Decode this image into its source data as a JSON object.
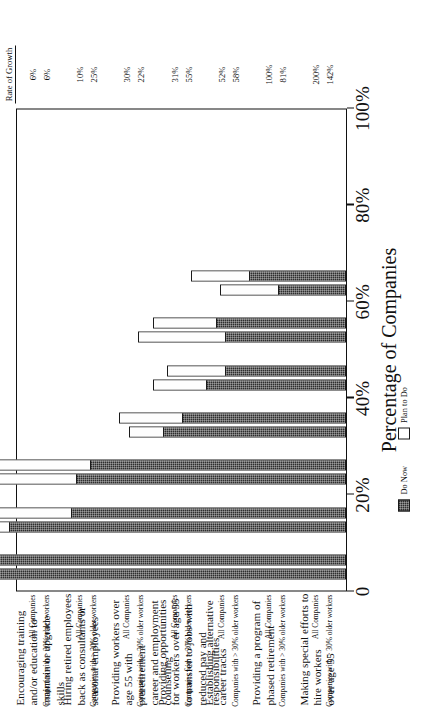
{
  "chart_data": {
    "type": "bar",
    "orientation": "horizontal-stacked",
    "title": "",
    "xlabel": "Percentage of Companies",
    "ylabel": "",
    "xlim": [
      0,
      100
    ],
    "xticks": [
      0,
      20,
      40,
      60,
      80,
      100
    ],
    "xticklabels": [
      "0",
      "20%",
      "40%",
      "60%",
      "80%",
      "100%"
    ],
    "grid": false,
    "legend_position": "below-axis",
    "legend": [
      "Do Now",
      "Plan to Do"
    ],
    "series_names": [
      "All Companies",
      "Companies with > 30% older workers"
    ],
    "categories": [
      "Encouraging training and/or education to\nmaintain or upgrade skills",
      "Hiring retired employees back as consultants or\nseasonal employees",
      "Providing workers over age 55 with preretirement\ncareer and employment counseling",
      "Providing opportunities for workers over age 55\nto transfer to jobs with reduced pay and responsibilities",
      "Establishing alternative career tracks",
      "Providing a program of phased retirement",
      "Making special efforts to hire workers\nover age 55"
    ],
    "rate_of_growth_header": "Rate of Growth",
    "bars": [
      {
        "category_index": 0,
        "series": "All Companies",
        "do_now": 80,
        "plan_to_do": 5,
        "total": 85,
        "rate_of_growth": "6%"
      },
      {
        "category_index": 0,
        "series": "Companies with > 30% older workers",
        "do_now": 84,
        "plan_to_do": 6,
        "total": 90,
        "rate_of_growth": "6%"
      },
      {
        "category_index": 1,
        "series": "All Companies",
        "do_now": 70,
        "plan_to_do": 8,
        "total": 78,
        "rate_of_growth": "10%"
      },
      {
        "category_index": 1,
        "series": "Companies with > 30% older workers",
        "do_now": 57,
        "plan_to_do": 30,
        "total": 87,
        "rate_of_growth": "25%"
      },
      {
        "category_index": 2,
        "series": "All Companies",
        "do_now": 56,
        "plan_to_do": 25,
        "total": 81,
        "rate_of_growth": "30%"
      },
      {
        "category_index": 2,
        "series": "Companies with > 30% older workers",
        "do_now": 53,
        "plan_to_do": 20,
        "total": 73,
        "rate_of_growth": "22%"
      },
      {
        "category_index": 3,
        "series": "All Companies",
        "do_now": 38,
        "plan_to_do": 7,
        "total": 45,
        "rate_of_growth": "31%"
      },
      {
        "category_index": 3,
        "series": "Companies with > 30% older workers",
        "do_now": 34,
        "plan_to_do": 13,
        "total": 47,
        "rate_of_growth": "55%"
      },
      {
        "category_index": 4,
        "series": "All Companies",
        "do_now": 29,
        "plan_to_do": 11,
        "total": 40,
        "rate_of_growth": "52%"
      },
      {
        "category_index": 4,
        "series": "Companies with > 30% older workers",
        "do_now": 25,
        "plan_to_do": 12,
        "total": 37,
        "rate_of_growth": "58%"
      },
      {
        "category_index": 5,
        "series": "All Companies",
        "do_now": 25,
        "plan_to_do": 18,
        "total": 43,
        "rate_of_growth": "100%"
      },
      {
        "category_index": 5,
        "series": "Companies with > 30% older workers",
        "do_now": 27,
        "plan_to_do": 13,
        "total": 40,
        "rate_of_growth": "81%"
      },
      {
        "category_index": 6,
        "series": "All Companies",
        "do_now": 14,
        "plan_to_do": 12,
        "total": 26,
        "rate_of_growth": "200%"
      },
      {
        "category_index": 6,
        "series": "Companies with > 30% older workers",
        "do_now": 20,
        "plan_to_do": 12,
        "total": 32,
        "rate_of_growth": "142%"
      }
    ]
  },
  "legend": {
    "do_now_label": "Do Now",
    "plan_to_do_label": "Plan to Do"
  },
  "axis": {
    "title": "Percentage of Companies"
  },
  "rate_of_growth": {
    "header": "Rate of Growth"
  }
}
